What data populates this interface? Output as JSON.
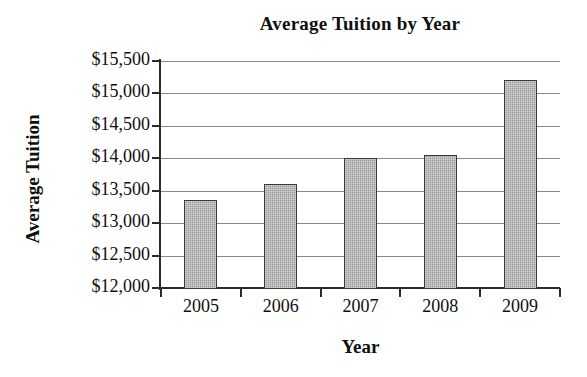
{
  "chart_data": {
    "type": "bar",
    "title": "Average Tuition by Year",
    "xlabel": "Year",
    "ylabel": "Average Tuition",
    "categories": [
      "2005",
      "2006",
      "2007",
      "2008",
      "2009"
    ],
    "values": [
      13350,
      13600,
      14000,
      14050,
      15200
    ],
    "ylim": [
      12000,
      15500
    ],
    "ytick_values": [
      12000,
      12500,
      13000,
      13500,
      14000,
      14500,
      15000,
      15500
    ],
    "ytick_labels": [
      "$12,000",
      "$12,500",
      "$13,000",
      "$13,500",
      "$14,000",
      "$14,500",
      "$15,000",
      "$15,500"
    ],
    "grid": true,
    "legend": "none",
    "bar_color": "#9d9d9d",
    "bar_edge_color": "#3a3a3a",
    "gridline_color": "#8a8a8a",
    "axis_color": "#2b2b2b",
    "background": "#ffffff"
  }
}
